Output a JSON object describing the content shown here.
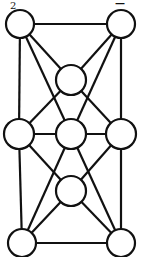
{
  "labels": {
    "corner_tl": "2",
    "corner_tr": "—"
  },
  "style": {
    "stroke": "#111111",
    "fill": "#ffffff",
    "stroke_width": 2.2
  },
  "nodes": [
    {
      "id": "TL",
      "x": 20,
      "y": 24,
      "r": 14
    },
    {
      "id": "TR",
      "x": 121,
      "y": 24,
      "r": 14
    },
    {
      "id": "UM",
      "x": 71,
      "y": 80,
      "r": 15
    },
    {
      "id": "ML",
      "x": 19,
      "y": 134,
      "r": 15
    },
    {
      "id": "MM",
      "x": 71,
      "y": 134,
      "r": 15
    },
    {
      "id": "MR",
      "x": 121,
      "y": 134,
      "r": 15
    },
    {
      "id": "LM",
      "x": 71,
      "y": 191,
      "r": 15
    },
    {
      "id": "BL",
      "x": 22,
      "y": 243,
      "r": 14
    },
    {
      "id": "BR",
      "x": 121,
      "y": 243,
      "r": 14
    }
  ],
  "edges": [
    [
      "TL",
      "TR"
    ],
    [
      "TL",
      "ML"
    ],
    [
      "TR",
      "MR"
    ],
    [
      "TL",
      "UM"
    ],
    [
      "TR",
      "UM"
    ],
    [
      "TL",
      "MM"
    ],
    [
      "TR",
      "MM"
    ],
    [
      "UM",
      "ML"
    ],
    [
      "UM",
      "MR"
    ],
    [
      "ML",
      "MM"
    ],
    [
      "MM",
      "MR"
    ],
    [
      "ML",
      "LM"
    ],
    [
      "MR",
      "LM"
    ],
    [
      "MM",
      "BL"
    ],
    [
      "MM",
      "BR"
    ],
    [
      "LM",
      "BL"
    ],
    [
      "LM",
      "BR"
    ],
    [
      "ML",
      "BL"
    ],
    [
      "MR",
      "BR"
    ],
    [
      "BL",
      "BR"
    ]
  ]
}
